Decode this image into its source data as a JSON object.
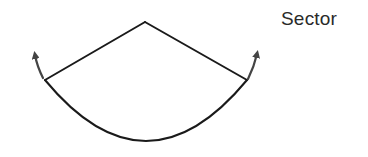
{
  "diagram": {
    "title": "Sector",
    "shape": "sector",
    "elements": [
      {
        "name": "left-radius",
        "type": "line",
        "from": [
          45,
          80
        ],
        "to": [
          145,
          22
        ]
      },
      {
        "name": "right-radius",
        "type": "line",
        "from": [
          145,
          22
        ],
        "to": [
          247,
          80
        ]
      },
      {
        "name": "arc",
        "type": "arc",
        "from": [
          45,
          80
        ],
        "to": [
          247,
          80
        ],
        "lowest_point": [
          145,
          141
        ]
      },
      {
        "name": "left-arrow",
        "type": "curved-arrow",
        "direction": "up-left"
      },
      {
        "name": "right-arrow",
        "type": "curved-arrow",
        "direction": "up-right"
      }
    ],
    "stroke_color": "#1a1a1a",
    "arrow_color": "#444444",
    "label_color": "#2a2a2a"
  }
}
